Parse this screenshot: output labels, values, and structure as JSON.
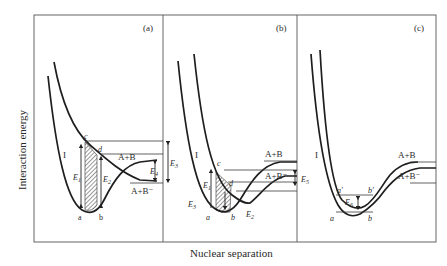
{
  "axes": {
    "ylabel": "Interaction energy",
    "xlabel": "Nuclear separation"
  },
  "panels": [
    {
      "id": "a",
      "tag": "(a)",
      "curve_label": "I",
      "points": {
        "a": "a",
        "b": "b",
        "c": "c",
        "d": "d"
      },
      "energies": {
        "E1": "E",
        "E1_sub": "1",
        "E2": "E",
        "E2_sub": "2",
        "E3": "E",
        "E3_sub": "3",
        "E4": "E",
        "E4_sub": "4"
      },
      "asymptotes": {
        "upper": "A+B",
        "lower": "A+B⁻"
      }
    },
    {
      "id": "b",
      "tag": "(b)",
      "curve_label": "I",
      "points": {
        "a": "a",
        "b": "b",
        "c": "c",
        "d": "d"
      },
      "energies": {
        "E1": "E",
        "E1_sub": "1",
        "E2": "E",
        "E2_sub": "2",
        "E3": "E",
        "E3_sub": "3",
        "E5": "E",
        "E5_sub": "5"
      },
      "asymptotes": {
        "upper": "A+B",
        "lower": "A+B⁻"
      }
    },
    {
      "id": "c",
      "tag": "(c)",
      "curve_label": "I",
      "points": {
        "a": "a",
        "b": "b",
        "a_prime": "a′",
        "b_prime": "b′"
      },
      "energies": {
        "E6": "E",
        "E6_sub": "6"
      },
      "asymptotes": {
        "upper": "A+B",
        "lower": "A+B⁻"
      }
    }
  ]
}
